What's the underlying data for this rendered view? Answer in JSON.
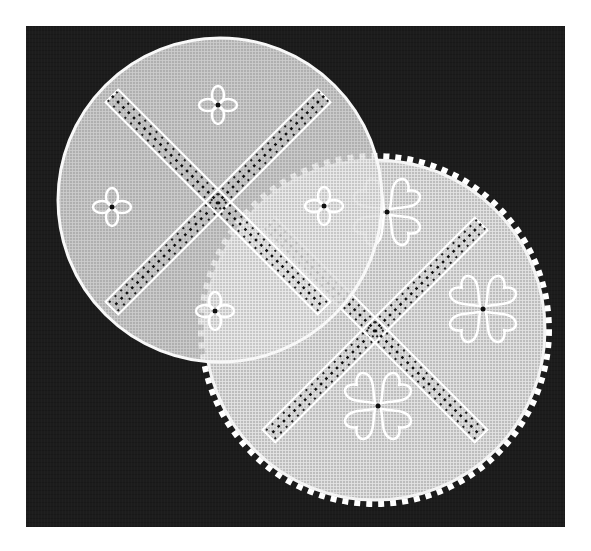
{
  "image": {
    "description": "Black-and-white photograph of two embroidered linen doilies overlapping on a dark background",
    "background_color": "#1c1c1c",
    "page_color": "#ffffff",
    "fabric_color": "#d8d8d8",
    "stitch_color": "#ffffff"
  },
  "doilies": [
    {
      "name": "round doily with plain edge",
      "shape": "circle",
      "motifs": [
        "diagonal cross of openwork bands",
        "4 small four-petal flowers"
      ]
    },
    {
      "name": "round doily with stepped zigzag edge",
      "shape": "circle-stepped",
      "motifs": [
        "diagonal cross of openwork bands",
        "4 large heart-petal flowers"
      ]
    }
  ]
}
